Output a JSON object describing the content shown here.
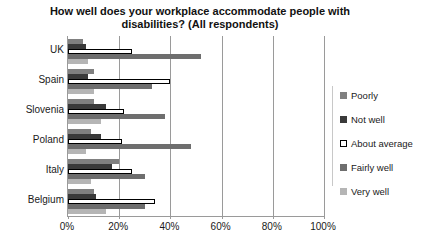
{
  "chart_data": {
    "type": "bar",
    "orientation": "horizontal",
    "title": "How well does your workplace accommodate people with disabilities? (All respondents)",
    "title_line1": "How well does your workplace accommodate people with",
    "title_line2": "disabilities? (All respondents)",
    "xlabel": "",
    "ylabel": "",
    "categories": [
      "UK",
      "Spain",
      "Slovenia",
      "Poland",
      "Italy",
      "Belgium"
    ],
    "xlim": [
      0,
      100
    ],
    "xtick_labels": [
      "0%",
      "20%",
      "40%",
      "60%",
      "80%",
      "100%"
    ],
    "xtick_values": [
      0,
      20,
      40,
      60,
      80,
      100
    ],
    "grid": true,
    "legend_position": "right",
    "series": [
      {
        "name": "Poorly",
        "color": "#808080",
        "values": [
          6,
          10,
          10,
          9,
          20,
          10
        ]
      },
      {
        "name": "Not well",
        "color": "#3a3a3a",
        "values": [
          7,
          8,
          15,
          13,
          17,
          11
        ]
      },
      {
        "name": "About average",
        "color": "#ffffff",
        "border": "#000000",
        "values": [
          25,
          40,
          22,
          21,
          25,
          34
        ]
      },
      {
        "name": "Fairly well",
        "color": "#6e6e6e",
        "values": [
          52,
          33,
          38,
          48,
          30,
          30
        ]
      },
      {
        "name": "Very well",
        "color": "#b5b5b5",
        "values": [
          8,
          10,
          13,
          7,
          9,
          15
        ]
      }
    ]
  },
  "legend": {
    "items": [
      {
        "label": "Poorly"
      },
      {
        "label": "Not well"
      },
      {
        "label": "About average"
      },
      {
        "label": "Fairly well"
      },
      {
        "label": "Very well"
      }
    ]
  }
}
